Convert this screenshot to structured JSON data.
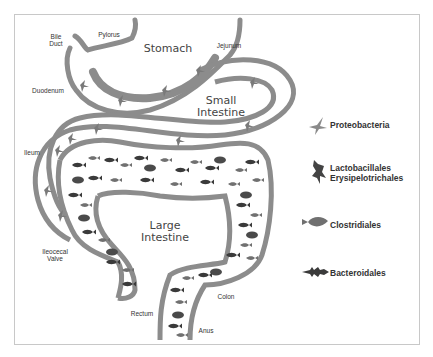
{
  "diagram": {
    "type": "gut-microbiota-distribution",
    "organs": {
      "stomach": "Stomach",
      "small_intestine": [
        "Small",
        "Intestine"
      ],
      "large_intestine": [
        "Large",
        "Intestine"
      ]
    },
    "anatomy_labels": {
      "bile_duct": [
        "Bile",
        "Duct"
      ],
      "pylorus": "Pylorus",
      "jejunum": "Jejunum",
      "duodenum": "Duodenum",
      "ileum": "Ileum",
      "ileocecal_valve": [
        "Ileocecal",
        "Valve"
      ],
      "rectum": "Rectum",
      "anus": "Anus",
      "colon": "Colon"
    },
    "legend": [
      {
        "icon": "swallow-icon",
        "label": "Proteobacteria"
      },
      {
        "icon": "hawk-icon",
        "label": "Lactobacillales",
        "label2": "Erysipelotrichales"
      },
      {
        "icon": "round-fish-icon",
        "label": "Clostridiales"
      },
      {
        "icon": "spiky-fish-icon",
        "label": "Bacteroidales"
      }
    ],
    "colors": {
      "tube": "#8c8c8c",
      "fish_dark": "#3a3a3a",
      "fish_mid": "#6e6e6e",
      "bird": "#7a7a7a",
      "frame": "#c8c8c8",
      "text": "#333333"
    }
  }
}
